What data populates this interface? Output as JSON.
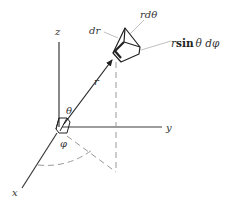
{
  "diagram": {
    "type": "spherical-coordinates-volume-element",
    "colors": {
      "axis": "#3a3a3a",
      "dashed": "#9a9a9a",
      "leader": "#b0b0b0",
      "box": "#222222",
      "text": "#333333"
    },
    "axes": {
      "z_label": "z",
      "y_label": "y",
      "x_label": "x"
    },
    "vector": {
      "r_label": "r"
    },
    "angles": {
      "theta_label": "θ",
      "phi_label": "φ"
    },
    "volume_element": {
      "dr_label": "dr",
      "rdtheta_label": "rdθ",
      "rsin_prefix": "r",
      "rsin_func": "sin",
      "rsin_suffix": "θ dφ"
    }
  }
}
